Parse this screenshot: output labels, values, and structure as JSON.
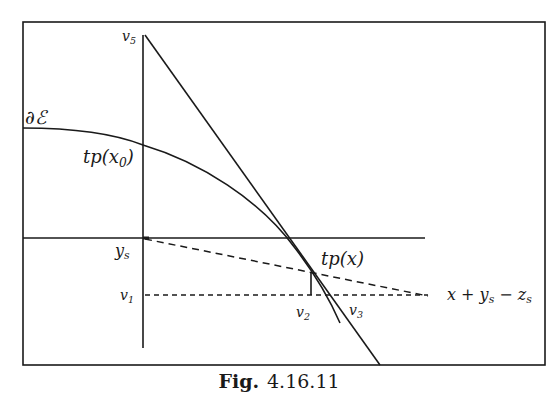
{
  "figure": {
    "caption_prefix": "Fig.",
    "caption_number": "4.16.11"
  },
  "labels": {
    "boundary": "∂ℰ",
    "tp_x0": {
      "main": "tp(x",
      "sub": "0",
      "close": ")"
    },
    "tp_x": "tp(x)",
    "ys": {
      "main": "y",
      "sub": "s"
    },
    "v1": {
      "main": "v",
      "sub": "1"
    },
    "v2": {
      "main": "v",
      "sub": "2"
    },
    "v3": {
      "main": "v",
      "sub": "3"
    },
    "v5": {
      "main": "v",
      "sub": "5"
    },
    "line_eq": {
      "a": "x + y",
      "sub1": "s",
      "b": " − z",
      "sub2": "s"
    }
  },
  "colors": {
    "ink": "#1a1a1a",
    "background": "#ffffff"
  }
}
